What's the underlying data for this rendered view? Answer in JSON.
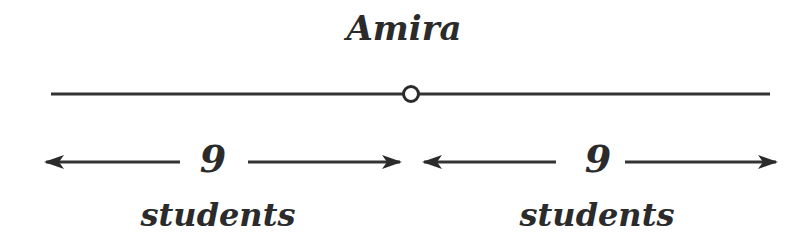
{
  "diagram": {
    "title": "Amira",
    "left": {
      "count": "9",
      "label": "students"
    },
    "right": {
      "count": "9",
      "label": "students"
    },
    "colors": {
      "ink": "#2b2b2b",
      "background": "#ffffff"
    }
  }
}
